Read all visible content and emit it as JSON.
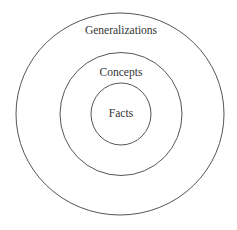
{
  "diagram": {
    "type": "concentric-circles",
    "layers": [
      {
        "label": "Generalizations",
        "level": "outer"
      },
      {
        "label": "Concepts",
        "level": "middle"
      },
      {
        "label": "Facts",
        "level": "inner"
      }
    ],
    "colors": {
      "stroke": "#555555",
      "text": "#333333",
      "background": "#ffffff"
    }
  }
}
